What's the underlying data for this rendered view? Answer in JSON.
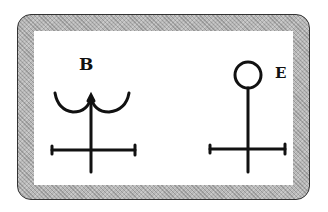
{
  "figure": {
    "symbols": [
      {
        "label": "B",
        "shape": "crescent-over-cross"
      },
      {
        "label": "E",
        "shape": "circle-over-cross"
      }
    ],
    "colors": {
      "ink": "#111111",
      "border_band": "#b8b8b8",
      "background": "#ffffff"
    }
  }
}
